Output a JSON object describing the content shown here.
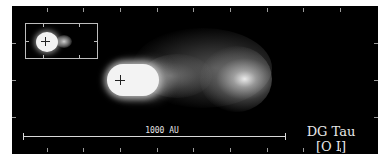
{
  "figure": {
    "object_name": "DG Tau",
    "emission_line": "[O I]",
    "scale_bar": {
      "label": "1000 AU"
    },
    "inset": {
      "description": "wide-scale view showing star and jet knot"
    },
    "colors": {
      "background": "#000000",
      "frame_ticks": "#9a9a9a",
      "text": "#e8e8e8",
      "emission_core": "#f4f4f4"
    },
    "markers": [
      {
        "name": "star-position-main",
        "symbol": "+"
      },
      {
        "name": "star-position-inset",
        "symbol": "+"
      }
    ]
  }
}
